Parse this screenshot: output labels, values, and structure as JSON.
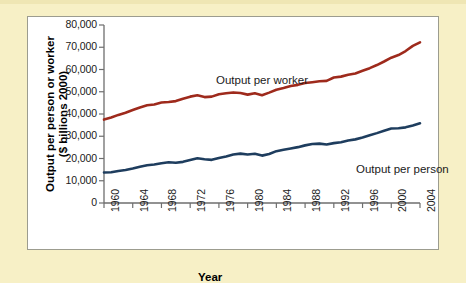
{
  "figure": {
    "background_color": "#f7f0c6",
    "panel_color": "#ffffff",
    "border_color": "#9c9c8f"
  },
  "axis": {
    "ylabel_line1": "Output per person or worker",
    "ylabel_line2": "($ billions 2000)",
    "ylabel": "Output per person or worker\n($ billions 2000)",
    "xlabel": "Year"
  },
  "labels": {
    "worker": "Output per worker",
    "person": "Output per person"
  },
  "chart_data": {
    "type": "line",
    "title": "",
    "subtitle": "",
    "xlabel": "Year",
    "ylabel": "Output per person or worker ($ billions 2000)",
    "xlim": [
      1960,
      2004
    ],
    "ylim": [
      0,
      80000
    ],
    "yticks": [
      0,
      10000,
      20000,
      30000,
      40000,
      50000,
      60000,
      70000,
      80000
    ],
    "ytick_labels": [
      "0",
      "10,000",
      "20,000",
      "30,000",
      "40,000",
      "50,000",
      "60,000",
      "70,000",
      "80,000"
    ],
    "xticks": [
      1960,
      1964,
      1968,
      1972,
      1976,
      1980,
      1984,
      1988,
      1992,
      1996,
      2000,
      2004
    ],
    "xtick_labels": [
      "1960",
      "1964",
      "1968",
      "1972",
      "1976",
      "1980",
      "1984",
      "1988",
      "1992",
      "1996",
      "2000",
      "2004"
    ],
    "grid": false,
    "legend_position": "inline-annotation",
    "x": [
      1960,
      1961,
      1962,
      1963,
      1964,
      1965,
      1966,
      1967,
      1968,
      1969,
      1970,
      1971,
      1972,
      1973,
      1974,
      1975,
      1976,
      1977,
      1978,
      1979,
      1980,
      1981,
      1982,
      1983,
      1984,
      1985,
      1986,
      1987,
      1988,
      1989,
      1990,
      1991,
      1992,
      1993,
      1994,
      1995,
      1996,
      1997,
      1998,
      1999,
      2000,
      2001,
      2002,
      2003,
      2004
    ],
    "series": [
      {
        "name": "Output per worker",
        "color": "#9e2a1c",
        "values": [
          37500,
          38400,
          39600,
          40600,
          41800,
          42900,
          43900,
          44300,
          45200,
          45400,
          45800,
          46900,
          47800,
          48400,
          47600,
          47800,
          48900,
          49300,
          49700,
          49400,
          48700,
          49300,
          48400,
          49600,
          50900,
          51700,
          52600,
          53100,
          53900,
          54300,
          54700,
          54900,
          56400,
          56800,
          57600,
          58200,
          59400,
          60600,
          62000,
          63600,
          65300,
          66500,
          68300,
          70600,
          72200
        ]
      },
      {
        "name": "Output per person",
        "color": "#1e3d5e",
        "values": [
          13700,
          13800,
          14400,
          14800,
          15500,
          16300,
          17000,
          17300,
          17900,
          18300,
          18100,
          18500,
          19300,
          20100,
          19700,
          19400,
          20200,
          20900,
          21800,
          22200,
          21800,
          22100,
          21300,
          22000,
          23300,
          23900,
          24500,
          25100,
          25900,
          26500,
          26700,
          26300,
          26900,
          27300,
          28100,
          28600,
          29400,
          30400,
          31400,
          32500,
          33500,
          33600,
          34000,
          34800,
          35800
        ]
      }
    ]
  }
}
